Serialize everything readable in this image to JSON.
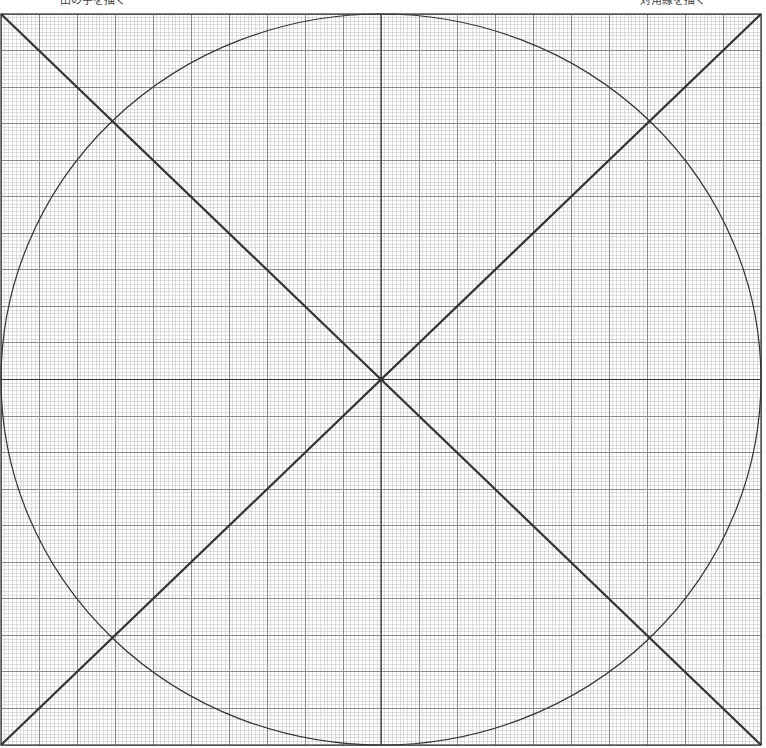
{
  "captions": {
    "left": "田の字を描く",
    "right": "対角線を描く"
  },
  "grid": {
    "left": 1,
    "top": 14,
    "right": 761,
    "bottom": 745,
    "major_divisions": 20,
    "minor_per_major": 10,
    "minor_color": "#c8c8c8",
    "major_color": "#8a8a8a",
    "border_color": "#333333"
  },
  "shapes": {
    "stroke_color": "#333333",
    "cross_lines": [
      "vertical-center",
      "horizontal-center"
    ],
    "diagonals": [
      "top-left-to-bottom-right",
      "top-right-to-bottom-left"
    ],
    "circle": "inscribed-ellipse"
  }
}
